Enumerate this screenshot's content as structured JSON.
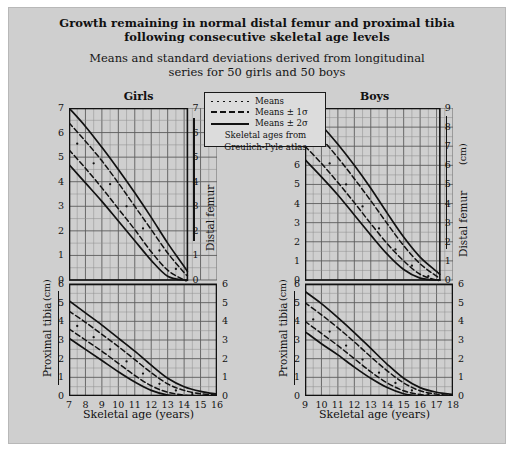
{
  "figure": {
    "title_line1": "Growth remaining in normal distal femur and proximal tibia",
    "title_line2": "following consecutive skeletal age levels",
    "subtitle_line1": "Means and standard deviations derived from longitudinal",
    "subtitle_line2": "series for 50 girls and 50 boys"
  },
  "legend": {
    "items": [
      {
        "key": "dotted",
        "label": "Means"
      },
      {
        "key": "dashed",
        "label": "Means ± 1σ"
      },
      {
        "key": "solid",
        "label": "Means ± 2σ"
      }
    ],
    "note_line1": "Skeletal ages from",
    "note_line2": "Greulich-Pyle atlas"
  },
  "axis_titles": {
    "left": "Proximal tibia",
    "right": "Distal femur",
    "unit": "(cm)",
    "x": "Skeletal age (years)"
  },
  "colors": {
    "background": "#cfcfcf",
    "page": "#ffffff",
    "ink": "#111111",
    "grid_minor": "#8d8d8d",
    "grid_major": "#5c5c5c",
    "legend_bg": "#dcdcdc"
  },
  "chart_data": [
    {
      "type": "line",
      "title": "Girls",
      "xlabel": "Skeletal age (years)",
      "xlim": [
        7,
        16
      ],
      "xticks": [
        7,
        8,
        9,
        10,
        11,
        12,
        13,
        14,
        15,
        16
      ],
      "grid": true,
      "legend_position": "top-center-shared",
      "panels": [
        {
          "name": "Distal femur",
          "ylabel": "Distal femur",
          "yunit": "(cm)",
          "ylim": [
            0,
            7
          ],
          "yticks": [
            0,
            1,
            2,
            3,
            4,
            5,
            6,
            7
          ],
          "axis_side": "right",
          "x_end": 14.2,
          "series": [
            {
              "name": "Means + 2σ",
              "style": "solid",
              "x": [
                7,
                8,
                9,
                10,
                11,
                12,
                13,
                14,
                14.2
              ],
              "y": [
                7.0,
                6.25,
                5.4,
                4.5,
                3.55,
                2.55,
                1.5,
                0.55,
                0.35
              ]
            },
            {
              "name": "Means + 1σ",
              "style": "dashed",
              "x": [
                7,
                8,
                9,
                10,
                11,
                12,
                13,
                14,
                14.2
              ],
              "y": [
                6.4,
                5.65,
                4.85,
                3.95,
                3.0,
                2.05,
                1.1,
                0.3,
                0.18
              ]
            },
            {
              "name": "Means",
              "style": "dotted",
              "x": [
                7.5,
                8.5,
                9.5,
                10.5,
                11.5,
                12.5,
                13.5
              ],
              "y": [
                5.55,
                4.75,
                3.9,
                3.0,
                2.1,
                1.2,
                0.45
              ]
            },
            {
              "name": "Means - 1σ",
              "style": "dashed",
              "x": [
                7,
                8,
                9,
                10,
                11,
                12,
                13,
                14,
                14.2
              ],
              "y": [
                5.3,
                4.55,
                3.75,
                2.9,
                2.05,
                1.15,
                0.4,
                0.0,
                0.0
              ]
            },
            {
              "name": "Means - 2σ",
              "style": "solid",
              "x": [
                7,
                8,
                9,
                10,
                11,
                12,
                13,
                14,
                14.2
              ],
              "y": [
                4.7,
                3.95,
                3.2,
                2.4,
                1.6,
                0.8,
                0.15,
                0.0,
                0.0
              ]
            }
          ]
        },
        {
          "name": "Proximal tibia",
          "ylabel": "Proximal tibia",
          "yunit": "(cm)",
          "ylim": [
            0,
            6
          ],
          "yticks": [
            0,
            1,
            2,
            3,
            4,
            5,
            6
          ],
          "axis_side": "left",
          "x_end": 16,
          "series": [
            {
              "name": "Means + 2σ",
              "style": "solid",
              "x": [
                7,
                8,
                9,
                10,
                11,
                12,
                13,
                14,
                15,
                16
              ],
              "y": [
                5.1,
                4.45,
                3.8,
                3.1,
                2.4,
                1.65,
                0.95,
                0.5,
                0.25,
                0.1
              ]
            },
            {
              "name": "Means + 1σ",
              "style": "dashed",
              "x": [
                7,
                8,
                9,
                10,
                11,
                12,
                13,
                14,
                15,
                16
              ],
              "y": [
                4.55,
                3.95,
                3.3,
                2.65,
                1.95,
                1.25,
                0.65,
                0.3,
                0.12,
                0.05
              ]
            },
            {
              "name": "Means",
              "style": "dotted",
              "x": [
                7.5,
                8.5,
                9.5,
                10.5,
                11.5,
                12.5,
                13.5,
                14.5
              ],
              "y": [
                3.75,
                3.15,
                2.5,
                1.85,
                1.2,
                0.65,
                0.3,
                0.1
              ]
            },
            {
              "name": "Means - 1σ",
              "style": "dashed",
              "x": [
                7,
                8,
                9,
                10,
                11,
                12,
                13,
                14,
                15,
                16
              ],
              "y": [
                3.6,
                3.0,
                2.4,
                1.75,
                1.1,
                0.55,
                0.2,
                0.05,
                0.0,
                0.0
              ]
            },
            {
              "name": "Means - 2σ",
              "style": "solid",
              "x": [
                7,
                8,
                9,
                10,
                11,
                12,
                13,
                14,
                15,
                16
              ],
              "y": [
                3.1,
                2.5,
                1.9,
                1.3,
                0.75,
                0.3,
                0.05,
                0.0,
                0.0,
                0.0
              ]
            }
          ]
        }
      ]
    },
    {
      "type": "line",
      "title": "Boys",
      "xlabel": "Skeletal age (years)",
      "xlim": [
        9,
        18
      ],
      "xticks": [
        9,
        10,
        11,
        12,
        13,
        14,
        15,
        16,
        17,
        18
      ],
      "grid": true,
      "legend_position": "top-center-shared",
      "panels": [
        {
          "name": "Distal femur",
          "ylabel": "Distal femur",
          "yunit": "(cm)",
          "ylim": [
            0,
            9
          ],
          "yticks": [
            0,
            1,
            2,
            3,
            4,
            5,
            6,
            7,
            8,
            9
          ],
          "axis_side": "right",
          "x_end": 17.2,
          "series": [
            {
              "name": "Means + 2σ",
              "style": "solid",
              "x": [
                9,
                10,
                11,
                12,
                13,
                14,
                15,
                16,
                17,
                17.2
              ],
              "y": [
                9.0,
                8.1,
                7.1,
                6.0,
                4.8,
                3.5,
                2.25,
                1.2,
                0.45,
                0.3
              ]
            },
            {
              "name": "Means + 1σ",
              "style": "dashed",
              "x": [
                9,
                10,
                11,
                12,
                13,
                14,
                15,
                16,
                17,
                17.2
              ],
              "y": [
                8.3,
                7.4,
                6.4,
                5.3,
                4.15,
                2.95,
                1.8,
                0.85,
                0.2,
                0.12
              ]
            },
            {
              "name": "Means",
              "style": "dotted",
              "x": [
                9.5,
                10.5,
                11.5,
                12.5,
                13.5,
                14.5,
                15.5,
                16.5
              ],
              "y": [
                7.1,
                6.1,
                5.0,
                3.85,
                2.7,
                1.6,
                0.75,
                0.2
              ]
            },
            {
              "name": "Means - 1σ",
              "style": "dashed",
              "x": [
                9,
                10,
                11,
                12,
                13,
                14,
                15,
                16,
                17,
                17.2
              ],
              "y": [
                7.0,
                6.1,
                5.1,
                4.05,
                2.95,
                1.9,
                1.0,
                0.3,
                0.0,
                0.0
              ]
            },
            {
              "name": "Means - 2σ",
              "style": "solid",
              "x": [
                9,
                10,
                11,
                12,
                13,
                14,
                15,
                16,
                17,
                17.2
              ],
              "y": [
                6.3,
                5.4,
                4.45,
                3.4,
                2.35,
                1.35,
                0.55,
                0.1,
                0.0,
                0.0
              ]
            }
          ]
        },
        {
          "name": "Proximal tibia",
          "ylabel": "Proximal tibia",
          "yunit": "(cm)",
          "ylim": [
            0,
            6
          ],
          "yticks": [
            0,
            1,
            2,
            3,
            4,
            5,
            6
          ],
          "axis_side": "left",
          "x_end": 18,
          "series": [
            {
              "name": "Means + 2σ",
              "style": "solid",
              "x": [
                9,
                10,
                11,
                12,
                13,
                14,
                15,
                16,
                17,
                18
              ],
              "y": [
                5.6,
                4.95,
                4.2,
                3.4,
                2.55,
                1.7,
                0.95,
                0.45,
                0.2,
                0.08
              ]
            },
            {
              "name": "Means + 1σ",
              "style": "dashed",
              "x": [
                9,
                10,
                11,
                12,
                13,
                14,
                15,
                16,
                17,
                18
              ],
              "y": [
                5.0,
                4.35,
                3.65,
                2.9,
                2.1,
                1.35,
                0.7,
                0.28,
                0.1,
                0.03
              ]
            },
            {
              "name": "Means",
              "style": "dotted",
              "x": [
                9.5,
                10.5,
                11.5,
                12.5,
                13.5,
                14.5,
                15.5,
                16.5
              ],
              "y": [
                4.1,
                3.45,
                2.7,
                1.95,
                1.25,
                0.7,
                0.3,
                0.1
              ]
            },
            {
              "name": "Means - 1σ",
              "style": "dashed",
              "x": [
                9,
                10,
                11,
                12,
                13,
                14,
                15,
                16,
                17,
                18
              ],
              "y": [
                4.0,
                3.35,
                2.7,
                2.0,
                1.3,
                0.7,
                0.28,
                0.08,
                0.0,
                0.0
              ]
            },
            {
              "name": "Means - 2σ",
              "style": "solid",
              "x": [
                9,
                10,
                11,
                12,
                13,
                14,
                15,
                16,
                17,
                18
              ],
              "y": [
                3.45,
                2.8,
                2.2,
                1.55,
                0.95,
                0.45,
                0.12,
                0.0,
                0.0,
                0.0
              ]
            }
          ]
        }
      ]
    }
  ]
}
